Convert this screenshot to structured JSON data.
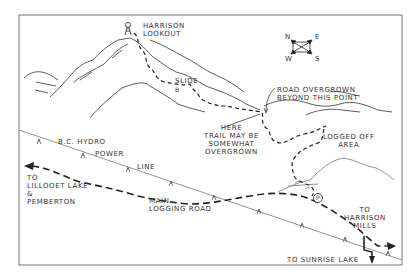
{
  "map": {
    "title": "Harrison Lookout Trail Map",
    "colors": {
      "ink": "#2a2a2a",
      "paper": "#ffffff",
      "faint": "#888888"
    },
    "labels": {
      "lookout": "HARRISON\nLOOKOUT",
      "slide": "SLIDE",
      "slide_marker": "B",
      "road_overgrown": "ROAD OVERGROWN\nBEYOND THIS POINT",
      "trail_overgrown": "HERE\nTRAIL MAY BE\nSOMEWHAT\nOVERGROWN",
      "logged_off": "LOGGED OFF\nAREA",
      "bc_hydro": "B.C. HYDRO",
      "power": "POWER",
      "line": "LINE",
      "lillooet": "TO\nLILLOOET LAKE\n&\nPEMBERTON",
      "main_road": "MAIN\nLOGGING ROAD",
      "harrison_mills": "TO\nHARRISON\nMILLS",
      "sunrise_lake": "TO SUNRISE LAKE",
      "parking": "P"
    },
    "compass": {
      "n": "N",
      "e": "E",
      "w": "W",
      "s": "S"
    },
    "icons": [
      "lookout-tower-icon",
      "compass-icon",
      "parking-icon",
      "arrow-icon",
      "power-pylon-icon"
    ]
  }
}
